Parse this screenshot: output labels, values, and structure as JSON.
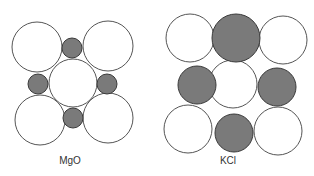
{
  "colors": {
    "anion_fill": "#ffffff",
    "cation_fill": "#7a7a7a",
    "stroke": "#555555",
    "label": "#333333"
  },
  "panels": [
    {
      "id": "mgo",
      "label": "MgO",
      "label_pos": [
        70,
        164
      ],
      "circles": [
        {
          "cx": 37,
          "cy": 47,
          "r": 25,
          "ion": "anion"
        },
        {
          "cx": 108,
          "cy": 46,
          "r": 25,
          "ion": "anion"
        },
        {
          "cx": 40,
          "cy": 120,
          "r": 25,
          "ion": "anion"
        },
        {
          "cx": 108,
          "cy": 118,
          "r": 25,
          "ion": "anion"
        },
        {
          "cx": 73,
          "cy": 83,
          "r": 24,
          "ion": "anion"
        },
        {
          "cx": 72,
          "cy": 48,
          "r": 10,
          "ion": "cation"
        },
        {
          "cx": 38,
          "cy": 84,
          "r": 10,
          "ion": "cation"
        },
        {
          "cx": 107,
          "cy": 84,
          "r": 10,
          "ion": "cation"
        },
        {
          "cx": 73,
          "cy": 118,
          "r": 10,
          "ion": "cation"
        }
      ]
    },
    {
      "id": "kcl",
      "label": "KCl",
      "label_pos": [
        228,
        164
      ],
      "circles": [
        {
          "cx": 190,
          "cy": 38,
          "r": 24,
          "ion": "anion"
        },
        {
          "cx": 236,
          "cy": 38,
          "r": 24,
          "ion": "cation"
        },
        {
          "cx": 283,
          "cy": 40,
          "r": 24,
          "ion": "anion"
        },
        {
          "cx": 197,
          "cy": 85,
          "r": 19,
          "ion": "cation"
        },
        {
          "cx": 233,
          "cy": 84,
          "r": 24,
          "ion": "anion"
        },
        {
          "cx": 277,
          "cy": 87,
          "r": 19,
          "ion": "cation"
        },
        {
          "cx": 188,
          "cy": 129,
          "r": 24,
          "ion": "anion"
        },
        {
          "cx": 234,
          "cy": 133,
          "r": 19,
          "ion": "cation"
        },
        {
          "cx": 278,
          "cy": 131,
          "r": 24,
          "ion": "anion"
        }
      ]
    }
  ]
}
